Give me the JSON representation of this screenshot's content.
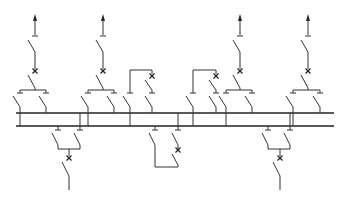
{
  "diagram": {
    "type": "electrical single-line diagram",
    "colors": {
      "line": "#333333",
      "bus": "#222222",
      "background": "#ffffff"
    },
    "busbars": [
      {
        "id": "bus-1",
        "y": 113,
        "x1": 16,
        "x2": 334
      },
      {
        "id": "bus-2",
        "y": 126,
        "x1": 16,
        "x2": 334
      }
    ],
    "top_feeders": [
      {
        "id": "feeder-top-1",
        "x": 35,
        "left_branch": 20,
        "right_branch": 46,
        "left_bus": "bus-2",
        "right_bus": "bus-1"
      },
      {
        "id": "feeder-top-2",
        "x": 103,
        "left_branch": 88,
        "right_branch": 114,
        "left_bus": "bus-2",
        "right_bus": "bus-1"
      },
      {
        "id": "feeder-top-3",
        "x": 240,
        "left_branch": 226,
        "right_branch": 252,
        "left_bus": "bus-2",
        "right_bus": "bus-1"
      },
      {
        "id": "feeder-top-4",
        "x": 308,
        "left_branch": 293,
        "right_branch": 320,
        "left_bus": "bus-2",
        "right_bus": "bus-1"
      }
    ],
    "couplers_top": [
      {
        "id": "coupler-1",
        "left_x": 130,
        "right_x": 152
      },
      {
        "id": "coupler-2",
        "left_x": 193,
        "right_x": 216
      }
    ],
    "bottom_feeders": [
      {
        "id": "feeder-bottom-1",
        "x": 69,
        "left_branch": 58,
        "right_branch": 80
      },
      {
        "id": "feeder-bottom-2",
        "x": 280,
        "left_branch": 268,
        "right_branch": 290
      }
    ],
    "coupler_bottom": {
      "id": "coupler-3",
      "left_x": 155,
      "right_x": 178
    },
    "symbols": {
      "arrow": "arrow-up-icon",
      "isolator": "disconnector-switch-icon",
      "breaker": "circuit-breaker-x-icon"
    }
  }
}
